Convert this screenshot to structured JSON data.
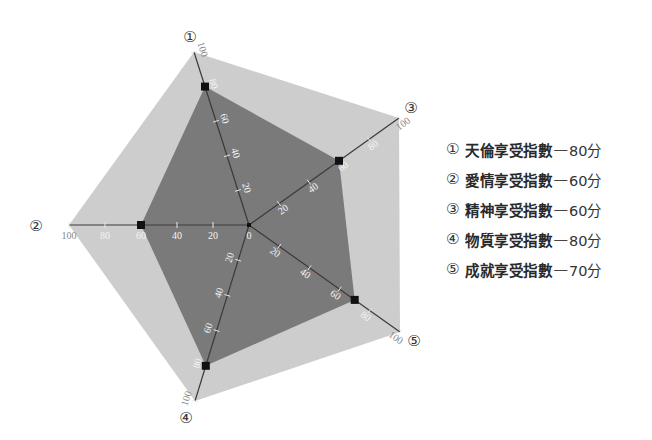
{
  "chart_data": {
    "type": "radar",
    "title": "",
    "axes": [
      {
        "id": 1,
        "marker": "①",
        "label": "天倫享受指數",
        "value": 80
      },
      {
        "id": 2,
        "marker": "②",
        "label": "愛情享受指數",
        "value": 60
      },
      {
        "id": 3,
        "marker": "③",
        "label": "精神享受指數",
        "value": 60
      },
      {
        "id": 4,
        "marker": "④",
        "label": "物質享受指數",
        "value": 80
      },
      {
        "id": 5,
        "marker": "⑤",
        "label": "成就享受指數",
        "value": 70
      }
    ],
    "range": [
      0,
      100
    ],
    "ticks": [
      0,
      20,
      40,
      60,
      80,
      100
    ],
    "series": [
      {
        "name": "score",
        "values": [
          80,
          60,
          60,
          80,
          70
        ],
        "color": "#7a7a7a"
      }
    ],
    "background_polygon_color": "#cdcdcd",
    "unit": "分",
    "legend_position": "right"
  },
  "legend": {
    "items": [
      {
        "num": "①",
        "label": "天倫享受指數",
        "dash": "—",
        "score": "80分"
      },
      {
        "num": "②",
        "label": "愛情享受指數",
        "dash": "—",
        "score": "60分"
      },
      {
        "num": "③",
        "label": "精神享受指數",
        "dash": "—",
        "score": "60分"
      },
      {
        "num": "④",
        "label": "物質享受指數",
        "dash": "—",
        "score": "80分"
      },
      {
        "num": "⑤",
        "label": "成就享受指數",
        "dash": "—",
        "score": "70分"
      }
    ]
  },
  "colors": {
    "inner": "#7a7a7a",
    "outer": "#cdcdcd",
    "axis": "#3a3a3a",
    "marker": "#111111"
  }
}
